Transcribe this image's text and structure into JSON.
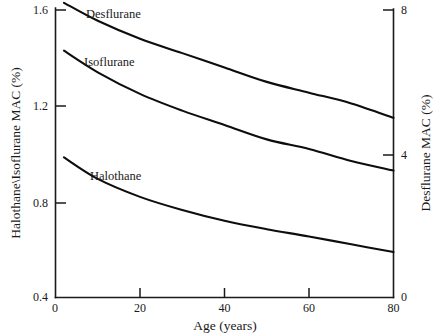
{
  "chart_data": {
    "type": "line",
    "title": "",
    "xlabel": "Age (years)",
    "ylabel": "Halothane\\Isoflurane MAC (%)",
    "y2label": "Desflurane MAC (%)",
    "xlim": [
      0,
      80
    ],
    "ylim": [
      0.4,
      1.6
    ],
    "y2lim": [
      0,
      8
    ],
    "xticks": [
      0,
      20,
      40,
      60,
      80
    ],
    "xticklabels": [
      "0",
      "20",
      "40",
      "60",
      "80"
    ],
    "yticks": [
      0.4,
      0.8,
      1.2,
      1.6
    ],
    "yticklabels": [
      "0.4",
      "0.8",
      "1.2",
      "1.6"
    ],
    "y2ticks": [
      0,
      4,
      8
    ],
    "y2ticklabels": [
      "0",
      "4",
      "8"
    ],
    "grid": false,
    "legend_position": "inline-annotations",
    "line_color": "#0d0d0d",
    "background_color": "#ffffff",
    "series": [
      {
        "name": "Desflurane",
        "axis": "right",
        "label_x": 86,
        "label_y": 18,
        "x": [
          2,
          10,
          20,
          30,
          40,
          50,
          60,
          70,
          80
        ],
        "values": [
          8.2,
          7.7,
          7.2,
          6.8,
          6.4,
          6.0,
          5.7,
          5.4,
          5.0
        ]
      },
      {
        "name": "Isoflurane",
        "axis": "left",
        "label_x": 84,
        "label_y": 66,
        "x": [
          2,
          10,
          20,
          30,
          40,
          50,
          60,
          70,
          80
        ],
        "values": [
          1.43,
          1.34,
          1.25,
          1.18,
          1.12,
          1.06,
          1.02,
          0.97,
          0.93
        ]
      },
      {
        "name": "Halothane",
        "axis": "left",
        "label_x": 90,
        "label_y": 180,
        "x": [
          2,
          10,
          20,
          30,
          40,
          50,
          60,
          70,
          80
        ],
        "values": [
          0.985,
          0.895,
          0.82,
          0.765,
          0.72,
          0.685,
          0.655,
          0.622,
          0.59
        ]
      }
    ]
  }
}
